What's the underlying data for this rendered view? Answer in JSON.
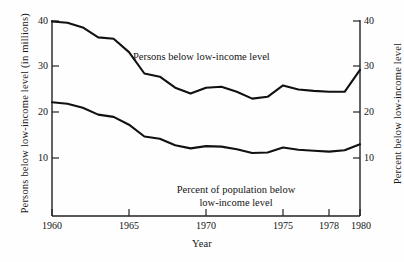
{
  "chart_data": {
    "type": "line",
    "title": "",
    "xlabel": "Year",
    "ylabel_left": "Persons below low-income level  (in millions)",
    "ylabel_right": "Percent below low-income level",
    "xlim": [
      1960,
      1980
    ],
    "ylim": [
      0,
      40
    ],
    "xticks": [
      1960,
      1965,
      1970,
      1975,
      1978,
      1980
    ],
    "xticklabels": [
      "1960",
      "1965",
      "1970",
      "1975",
      "1978",
      "1980"
    ],
    "yticks_left": [
      10,
      20,
      30,
      40
    ],
    "yticklabels_left": [
      "10",
      "20",
      "30",
      "40"
    ],
    "yticks_right": [
      10,
      20,
      30,
      40
    ],
    "yticklabels_right": [
      "10",
      "20",
      "30",
      "40"
    ],
    "grid": false,
    "legend_position": "inline-annotations",
    "annotations": [
      {
        "id": "persons-annotation",
        "text": "Persons below low-income level",
        "series": "persons_below_low_income_millions"
      },
      {
        "id": "percent-annotation",
        "line1": "Percent of population below",
        "line2": "low-income level",
        "series": "percent_below_low_income"
      }
    ],
    "x": [
      1960,
      1961,
      1962,
      1963,
      1964,
      1965,
      1966,
      1967,
      1968,
      1969,
      1970,
      1971,
      1972,
      1973,
      1974,
      1975,
      1976,
      1977,
      1978,
      1979,
      1980
    ],
    "series": [
      {
        "name": "Persons below low-income level",
        "units": "millions",
        "axis": "left",
        "values": [
          39.9,
          39.6,
          38.6,
          36.4,
          36.1,
          33.2,
          28.5,
          27.8,
          25.4,
          24.1,
          25.4,
          25.6,
          24.5,
          23.0,
          23.4,
          25.9,
          25.0,
          24.7,
          24.5,
          24.5,
          29.3
        ]
      },
      {
        "name": "Percent of population below low-income level",
        "units": "percent",
        "axis": "right",
        "values": [
          22.2,
          21.9,
          21.0,
          19.5,
          19.0,
          17.3,
          14.7,
          14.2,
          12.8,
          12.1,
          12.6,
          12.5,
          11.9,
          11.1,
          11.2,
          12.3,
          11.8,
          11.6,
          11.4,
          11.7,
          13.0
        ]
      }
    ],
    "colors": {
      "line": "#111111",
      "axis": "#222222",
      "background": "#fefefe"
    }
  }
}
